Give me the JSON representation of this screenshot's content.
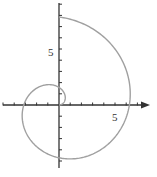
{
  "chart_data": {
    "type": "line",
    "title": "",
    "xlabel": "",
    "ylabel": "",
    "equation": "r = theta",
    "theta_range": [
      0,
      7.854
    ],
    "xlim": [
      -5.2,
      7.9
    ],
    "ylim": [
      -5.6,
      9.2
    ],
    "grid": false,
    "legend": null,
    "x_tick_labels": [
      {
        "value": 5,
        "label": "5"
      }
    ],
    "y_tick_labels": [
      {
        "value": 5,
        "label": "5"
      }
    ],
    "tick_spacing": 1,
    "series": [
      {
        "name": "r = θ",
        "key_points": [
          {
            "theta": 0,
            "x": 0,
            "y": 0
          },
          {
            "theta": 1.571,
            "x": 0,
            "y": 1.571
          },
          {
            "theta": 3.142,
            "x": -3.142,
            "y": 0
          },
          {
            "theta": 4.712,
            "x": 0,
            "y": -4.712
          },
          {
            "theta": 6.283,
            "x": 6.283,
            "y": 0
          },
          {
            "theta": 7.854,
            "x": 0,
            "y": 7.854
          }
        ]
      }
    ],
    "colors": {
      "curve": "#a0a0a0",
      "axes": "#333333"
    }
  }
}
